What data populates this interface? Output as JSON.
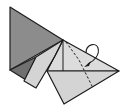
{
  "diagram": {
    "type": "origami-fold-step",
    "colors": {
      "background": "#ffffff",
      "dark_paper": "#8c8c8c",
      "darker_paper": "#707070",
      "light_paper": "#d4d4d4",
      "lighter_paper": "#dcdcdc",
      "stroke": "#1e1e1e"
    },
    "elements": [
      {
        "name": "dark-back-triangle",
        "kind": "polygon"
      },
      {
        "name": "dark-lower-wedge",
        "kind": "polygon"
      },
      {
        "name": "light-flap",
        "kind": "polygon"
      },
      {
        "name": "right-light-triangle",
        "kind": "polygon"
      },
      {
        "name": "bottom-flap",
        "kind": "polygon"
      },
      {
        "name": "valley-fold-line",
        "kind": "dashed-line"
      },
      {
        "name": "fold-over-arrow",
        "kind": "arrow"
      }
    ]
  }
}
